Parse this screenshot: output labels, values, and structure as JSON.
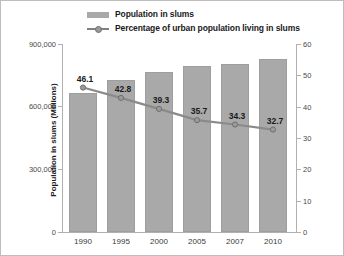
{
  "legend": {
    "items": [
      {
        "label": "Population in slums",
        "key": "bar-swatch",
        "color": "#a9a9a9"
      },
      {
        "label": "Percentage of urban population living in slums",
        "key": "line-marker",
        "color": "#808080"
      }
    ]
  },
  "axes": {
    "left": {
      "title": "Population in slums (Millions)",
      "ticks": [
        "900,000",
        "600,000",
        "300,000",
        "0"
      ],
      "min": 0,
      "max": 900000
    },
    "right": {
      "title": "Proportion of urban population in slums (Percentage)",
      "ticks": [
        "60",
        "50",
        "40",
        "30",
        "20",
        "10",
        "0"
      ],
      "min": 0,
      "max": 60
    }
  },
  "chart_data": {
    "type": "bar",
    "title": "",
    "xlabel": "",
    "ylabel": "Population in slums (Millions)",
    "y2label": "Proportion of urban population in slums (Percentage)",
    "categories": [
      "1990",
      "1995",
      "2000",
      "2005",
      "2007",
      "2010"
    ],
    "ylim": [
      0,
      900000
    ],
    "y2lim": [
      0,
      60
    ],
    "grid": false,
    "legend_position": "top",
    "series": [
      {
        "name": "Population in slums",
        "type": "bar",
        "axis": "left",
        "color": "#a9a9a9",
        "values": [
          665000,
          728000,
          766000,
          795000,
          804000,
          828000
        ]
      },
      {
        "name": "Percentage of urban population living in slums",
        "type": "line",
        "axis": "right",
        "color": "#808080",
        "values": [
          46.1,
          42.8,
          39.3,
          35.7,
          34.3,
          32.7
        ],
        "data_labels": [
          "46.1",
          "42.8",
          "39.3",
          "35.7",
          "34.3",
          "32.7"
        ]
      }
    ]
  }
}
